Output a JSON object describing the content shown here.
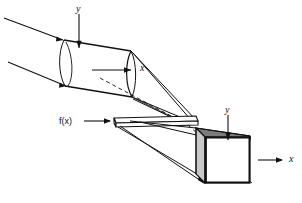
{
  "figure": {
    "background_color": "#ffffff",
    "ink_color": "#111111",
    "labels": {
      "input_axis_y": "y",
      "input_axis_x": "x",
      "transparency": "f(x)",
      "output_axis_y": "y",
      "output_axis_x": "x"
    },
    "elements": {
      "input_cylinder": "input beam cylinder",
      "transparency_slab": "thin transparency plate",
      "output_box": "output beam box",
      "rays": "ray bundle"
    }
  }
}
